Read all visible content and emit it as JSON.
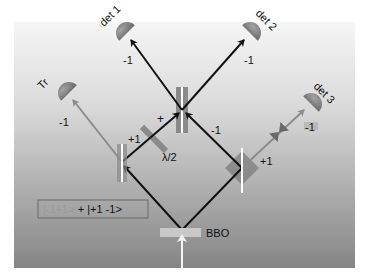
{
  "diagram": {
    "title": "",
    "background": {
      "top_color": "#f4f4f4",
      "bottom_color": "#858585"
    },
    "source": {
      "label": "BBO"
    },
    "detectors": [
      {
        "id": "det1",
        "label": "det 1",
        "mode": "-1"
      },
      {
        "id": "det2",
        "label": "det 2",
        "mode": "-1"
      },
      {
        "id": "det3",
        "label": "det 3",
        "mode": "-1"
      },
      {
        "id": "tr",
        "label": "Tr",
        "mode": "-1"
      }
    ],
    "beam_labels": {
      "left_arm": "+1",
      "center_left": "+",
      "center_right": "-1",
      "right_arm": "+1"
    },
    "waveplate": {
      "label": "λ/2"
    },
    "state": {
      "faded_term": "|-1+1>",
      "plus": "+",
      "term": "|+1 -1>"
    },
    "colors": {
      "beam_black": "#111111",
      "beam_gray": "#8c8c8c",
      "detector": "#8a8a8a",
      "splitter_white": "#ffffff"
    }
  }
}
